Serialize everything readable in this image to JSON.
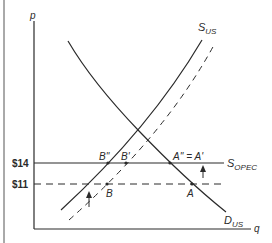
{
  "diagram": {
    "type": "supply-demand",
    "axes": {
      "y_label": "p",
      "x_label": "q"
    },
    "price_levels": [
      {
        "label": "$14",
        "value": 14,
        "style": "solid",
        "curve_label_main": "S",
        "curve_label_sub": "OPEC"
      },
      {
        "label": "$11",
        "value": 11,
        "style": "dashed"
      }
    ],
    "curves": {
      "supply_us": {
        "main": "S",
        "sub": "US"
      },
      "demand_us": {
        "main": "D",
        "sub": "US"
      }
    },
    "points": {
      "b_double_prime": "B''",
      "b_prime": "B'",
      "b": "B",
      "a_double_prime_eq_a_prime": "A'' = A'",
      "a": "A"
    },
    "colors": {
      "line": "#2a2a2a",
      "background": "#ffffff"
    }
  }
}
